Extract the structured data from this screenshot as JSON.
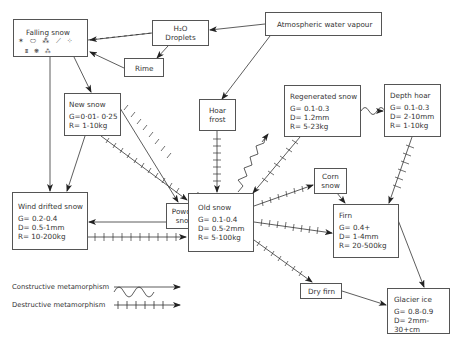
{
  "diagram": {
    "nodes": {
      "falling_snow": {
        "title": "Falling snow",
        "crystal_glyphs_row1": "✶ ⬭ ⁂ ⟋ ⁘",
        "crystal_glyphs_row2": "⩩   ❋  ⁂"
      },
      "h2o_droplets": {
        "line1": "H₂O",
        "line2": "Droplets"
      },
      "atmospheric_water_vapour": {
        "title": "Atmospheric water vapour"
      },
      "rime": {
        "title": "Rime"
      },
      "hoar_frost": {
        "line1": "Hoar",
        "line2": "frost"
      },
      "regenerated_snow": {
        "title": "Regenerated snow",
        "G": "G= 0.1-0.3",
        "D": "D= 1.2mm",
        "R": "R= 5-23kg"
      },
      "depth_hoar": {
        "title": "Depth hoar",
        "G": "G= 0.1-0.3",
        "D": "D= 2-10mm",
        "R": "R= 1-10kg"
      },
      "new_snow": {
        "title": "New snow",
        "G": "G=0·01- 0·25",
        "R": "R= 1-10kg"
      },
      "powder_snow": {
        "line1": "Powder",
        "line2": "snow"
      },
      "old_snow": {
        "title": "Old snow",
        "G": "G= 0.1-0.4",
        "D": "D= 0.5-2mm",
        "R": "R= 5-100kg"
      },
      "corn_snow": {
        "line1": "Corn",
        "line2": "snow"
      },
      "wind_drifted_snow": {
        "title": "Wind drifted snow",
        "G": "G= 0.2-0.4",
        "D": "D= 0.5-1mm",
        "R": "R= 10-200kg"
      },
      "firn": {
        "title": "Firn",
        "G": "G= 0.4+",
        "D": "D= 1-4mm",
        "R": "R= 20-500kg"
      },
      "dry_firn": {
        "title": "Dry firn"
      },
      "glacier_ice": {
        "title": "Glacier ice",
        "G": "G= 0.8-0.9",
        "D": "D= 2mm-30+cm"
      }
    },
    "legend": {
      "constructive": "Constructive metamorphism",
      "destructive": "Destructive metamorphism"
    },
    "colors": {
      "line": "#333333",
      "box_border": "#555555",
      "background": "#ffffff"
    }
  }
}
